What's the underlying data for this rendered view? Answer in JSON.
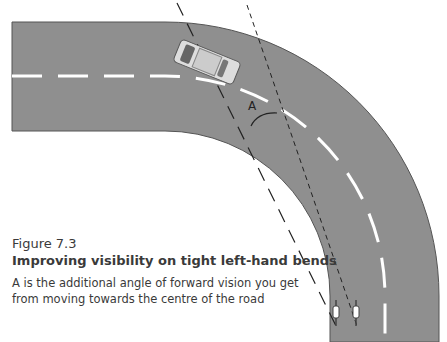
{
  "figure": {
    "number": "Figure 7.3",
    "title": "Improving visibility on tight left-hand bends",
    "description": "A is the additional angle of forward vision you get from moving towards the centre of the road",
    "angle_label": "A"
  },
  "colors": {
    "road": "#8f8f8f",
    "edge": "#555555",
    "center_line": "#ffffff",
    "sight_line": "#222222"
  }
}
